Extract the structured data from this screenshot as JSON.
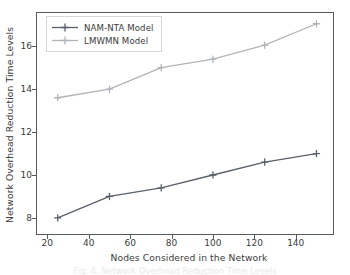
{
  "chart_data": {
    "type": "line",
    "title": "",
    "xlabel": "Nodes Considered in the Network",
    "ylabel": "Network Overhead Reduction Time Levels",
    "x": [
      25,
      50,
      75,
      100,
      125,
      150
    ],
    "series": [
      {
        "name": "NAM-NTA Model",
        "color": "#5a6069",
        "marker": "plus",
        "values": [
          8.0,
          9.0,
          9.4,
          10.0,
          10.6,
          11.0
        ]
      },
      {
        "name": "LMWMN Model",
        "color": "#b0b4b8",
        "marker": "plus",
        "values": [
          13.6,
          14.0,
          15.0,
          15.4,
          16.05,
          17.05
        ]
      }
    ],
    "xlim": [
      15,
      158
    ],
    "ylim": [
      7.25,
      17.55
    ],
    "xticks": [
      20,
      40,
      60,
      80,
      100,
      120,
      140
    ],
    "xtick_labels": [
      "20",
      "40",
      "60",
      "80",
      "100",
      "120",
      "140"
    ],
    "yticks": [
      8,
      10,
      12,
      14,
      16
    ],
    "ytick_labels": [
      "8",
      "10",
      "12",
      "14",
      "16"
    ],
    "grid": false,
    "legend_position": "upper left",
    "frame_color": "#555a5e",
    "background": "#ffffff"
  },
  "legend": {
    "items": [
      {
        "label": "NAM-NTA Model"
      },
      {
        "label": "LMWMN Model"
      }
    ]
  },
  "caption": {
    "text": "Fig. 4. Network Overhead Reduction Time Levels"
  }
}
